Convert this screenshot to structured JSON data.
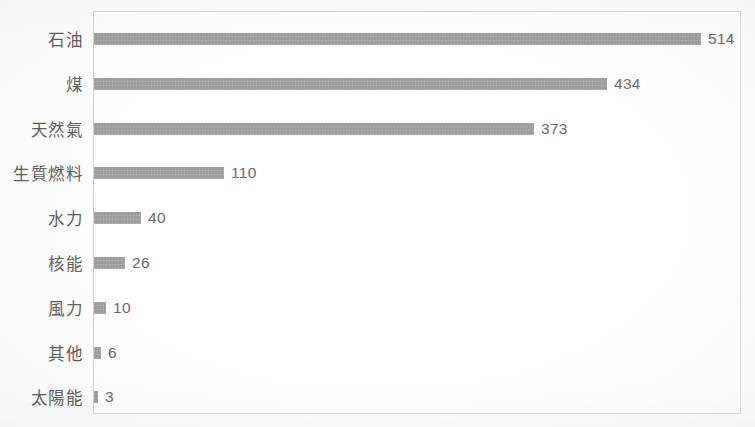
{
  "chart_data": {
    "type": "bar",
    "orientation": "horizontal",
    "title": "",
    "subtitle": "",
    "xlabel": "",
    "ylabel": "",
    "categories": [
      "石油",
      "煤",
      "天然氣",
      "生質燃料",
      "水力",
      "核能",
      "風力",
      "其他",
      "太陽能"
    ],
    "values": [
      514,
      434,
      373,
      110,
      40,
      26,
      10,
      6,
      3
    ],
    "value_labels": [
      "514",
      "434",
      "373",
      "110",
      "40",
      "26",
      "10",
      "6",
      "3"
    ],
    "xlim": [
      0,
      545
    ],
    "ylim": null,
    "grid": false,
    "legend": false,
    "legend_position": "none",
    "data_labels_shown": true,
    "series": [
      {
        "name": "",
        "values": [
          514,
          434,
          373,
          110,
          40,
          26,
          10,
          6,
          3
        ]
      }
    ],
    "bars": [
      {
        "category": "石油",
        "value": 514,
        "label": "514"
      },
      {
        "category": "煤",
        "value": 434,
        "label": "434"
      },
      {
        "category": "天然氣",
        "value": 373,
        "label": "373"
      },
      {
        "category": "生質燃料",
        "value": 110,
        "label": "110"
      },
      {
        "category": "水力",
        "value": 40,
        "label": "40"
      },
      {
        "category": "核能",
        "value": 26,
        "label": "26"
      },
      {
        "category": "風力",
        "value": 10,
        "label": "10"
      },
      {
        "category": "其他",
        "value": 6,
        "label": "6"
      },
      {
        "category": "太陽能",
        "value": 3,
        "label": "3"
      }
    ]
  },
  "style": {
    "bar_color": "#9b9b9b",
    "label_color": "#5d5d5d",
    "value_color": "#6a6a6a",
    "frame_color": "#dcdcdc",
    "axis_color": "#d2d2d2",
    "background": "#fdfdfd",
    "plot_background": "#ffffff"
  },
  "geometry": {
    "canvas_width": 755,
    "canvas_height": 427,
    "plot_left": 93,
    "plot_top": 11,
    "plot_width": 648,
    "plot_height": 403,
    "px_per_unit": 1.1809,
    "row_pitch": 44.8,
    "first_row_center": 39,
    "bar_height": 12
  }
}
